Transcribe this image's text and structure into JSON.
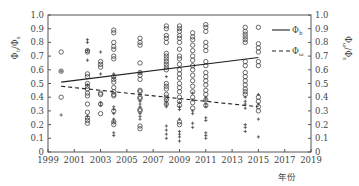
{
  "chart_data": {
    "type": "scatter",
    "title": "",
    "xlabel": "年份",
    "ylabel_left": "Φ_l/Φ_s (Φ_b/Φ_s)",
    "ylabel_right": "Φ_ω/Φ_s",
    "xlim": [
      1999,
      2019
    ],
    "ylim": [
      0,
      1.0
    ],
    "x_ticks": [
      "1999",
      "2001",
      "2003",
      "2005",
      "2007",
      "2009",
      "2011",
      "2013",
      "2015",
      "2017",
      "2019"
    ],
    "y_ticks": [
      "0",
      "0.1",
      "0.2",
      "0.3",
      "0.4",
      "0.5",
      "0.6",
      "0.7",
      "0.8",
      "0.9",
      "1.0"
    ],
    "grid": false,
    "legend_position": "upper right (outside plot)",
    "legend": [
      {
        "label": "Φ_b",
        "style": "solid"
      },
      {
        "label": "Φ_ω",
        "style": "dashed"
      }
    ],
    "trend_lines": [
      {
        "name": "Φ_b",
        "style": "solid",
        "x": [
          2000,
          2015
        ],
        "y": [
          0.51,
          0.69
        ]
      },
      {
        "name": "Φ_ω",
        "style": "dashed",
        "x": [
          2000,
          2015
        ],
        "y": [
          0.48,
          0.33
        ]
      }
    ],
    "series": [
      {
        "name": "circles",
        "marker": "o",
        "points": [
          [
            2000,
            0.73
          ],
          [
            2000,
            0.59
          ],
          [
            2000,
            0.4
          ],
          [
            2002,
            0.74
          ],
          [
            2002,
            0.73
          ],
          [
            2002,
            0.57
          ],
          [
            2002,
            0.55
          ],
          [
            2002,
            0.5
          ],
          [
            2002,
            0.48
          ],
          [
            2002,
            0.46
          ],
          [
            2002,
            0.43
          ],
          [
            2002,
            0.41
          ],
          [
            2002,
            0.35
          ],
          [
            2002,
            0.29
          ],
          [
            2002,
            0.25
          ],
          [
            2002,
            0.23
          ],
          [
            2002,
            0.21
          ],
          [
            2003,
            0.66
          ],
          [
            2003,
            0.64
          ],
          [
            2003,
            0.62
          ],
          [
            2003,
            0.43
          ],
          [
            2003,
            0.42
          ],
          [
            2003,
            0.35
          ],
          [
            2003,
            0.28
          ],
          [
            2004,
            0.89
          ],
          [
            2004,
            0.87
          ],
          [
            2004,
            0.8
          ],
          [
            2004,
            0.77
          ],
          [
            2004,
            0.75
          ],
          [
            2004,
            0.7
          ],
          [
            2004,
            0.68
          ],
          [
            2004,
            0.55
          ],
          [
            2004,
            0.53
          ],
          [
            2004,
            0.51
          ],
          [
            2004,
            0.47
          ],
          [
            2004,
            0.44
          ],
          [
            2004,
            0.42
          ],
          [
            2004,
            0.41
          ],
          [
            2004,
            0.3
          ],
          [
            2004,
            0.22
          ],
          [
            2004,
            0.2
          ],
          [
            2006,
            0.83
          ],
          [
            2006,
            0.8
          ],
          [
            2006,
            0.78
          ],
          [
            2006,
            0.65
          ],
          [
            2006,
            0.58
          ],
          [
            2006,
            0.56
          ],
          [
            2006,
            0.53
          ],
          [
            2006,
            0.45
          ],
          [
            2006,
            0.44
          ],
          [
            2006,
            0.4
          ],
          [
            2006,
            0.39
          ],
          [
            2006,
            0.31
          ],
          [
            2006,
            0.3
          ],
          [
            2006,
            0.19
          ],
          [
            2006,
            0.17
          ],
          [
            2008,
            0.92
          ],
          [
            2008,
            0.9
          ],
          [
            2008,
            0.85
          ],
          [
            2008,
            0.83
          ],
          [
            2008,
            0.8
          ],
          [
            2008,
            0.72
          ],
          [
            2008,
            0.7
          ],
          [
            2008,
            0.68
          ],
          [
            2008,
            0.66
          ],
          [
            2008,
            0.64
          ],
          [
            2008,
            0.62
          ],
          [
            2008,
            0.6
          ],
          [
            2008,
            0.5
          ],
          [
            2008,
            0.48
          ],
          [
            2008,
            0.46
          ],
          [
            2008,
            0.42
          ],
          [
            2008,
            0.4
          ],
          [
            2008,
            0.38
          ],
          [
            2008,
            0.35
          ],
          [
            2009,
            0.92
          ],
          [
            2009,
            0.9
          ],
          [
            2009,
            0.88
          ],
          [
            2009,
            0.85
          ],
          [
            2009,
            0.83
          ],
          [
            2009,
            0.8
          ],
          [
            2009,
            0.75
          ],
          [
            2009,
            0.7
          ],
          [
            2009,
            0.68
          ],
          [
            2009,
            0.64
          ],
          [
            2009,
            0.6
          ],
          [
            2009,
            0.57
          ],
          [
            2009,
            0.54
          ],
          [
            2009,
            0.5
          ],
          [
            2009,
            0.47
          ],
          [
            2009,
            0.44
          ],
          [
            2009,
            0.4
          ],
          [
            2009,
            0.37
          ],
          [
            2009,
            0.34
          ],
          [
            2009,
            0.22
          ],
          [
            2009,
            0.2
          ],
          [
            2010,
            0.87
          ],
          [
            2010,
            0.84
          ],
          [
            2010,
            0.82
          ],
          [
            2010,
            0.78
          ],
          [
            2010,
            0.74
          ],
          [
            2010,
            0.7
          ],
          [
            2010,
            0.67
          ],
          [
            2010,
            0.63
          ],
          [
            2010,
            0.6
          ],
          [
            2010,
            0.56
          ],
          [
            2010,
            0.52
          ],
          [
            2010,
            0.48
          ],
          [
            2010,
            0.44
          ],
          [
            2010,
            0.4
          ],
          [
            2010,
            0.36
          ],
          [
            2010,
            0.32
          ],
          [
            2011,
            0.93
          ],
          [
            2011,
            0.91
          ],
          [
            2011,
            0.88
          ],
          [
            2011,
            0.8
          ],
          [
            2011,
            0.77
          ],
          [
            2011,
            0.74
          ],
          [
            2011,
            0.66
          ],
          [
            2011,
            0.63
          ],
          [
            2011,
            0.58
          ],
          [
            2011,
            0.55
          ],
          [
            2011,
            0.52
          ],
          [
            2011,
            0.49
          ],
          [
            2011,
            0.45
          ],
          [
            2011,
            0.42
          ],
          [
            2011,
            0.38
          ],
          [
            2011,
            0.34
          ],
          [
            2014,
            0.91
          ],
          [
            2014,
            0.88
          ],
          [
            2014,
            0.86
          ],
          [
            2014,
            0.84
          ],
          [
            2014,
            0.82
          ],
          [
            2014,
            0.8
          ],
          [
            2014,
            0.66
          ],
          [
            2014,
            0.63
          ],
          [
            2014,
            0.58
          ],
          [
            2014,
            0.55
          ],
          [
            2014,
            0.52
          ],
          [
            2014,
            0.49
          ],
          [
            2014,
            0.46
          ],
          [
            2014,
            0.44
          ],
          [
            2014,
            0.42
          ],
          [
            2015,
            0.91
          ],
          [
            2015,
            0.79
          ],
          [
            2015,
            0.76
          ],
          [
            2015,
            0.73
          ],
          [
            2015,
            0.66
          ],
          [
            2015,
            0.63
          ],
          [
            2015,
            0.4
          ],
          [
            2015,
            0.37
          ],
          [
            2015,
            0.33
          ],
          [
            2015,
            0.3
          ]
        ]
      },
      {
        "name": "crosses",
        "marker": "+",
        "points": [
          [
            2000,
            0.59
          ],
          [
            2000,
            0.27
          ],
          [
            2002,
            0.82
          ],
          [
            2002,
            0.8
          ],
          [
            2002,
            0.74
          ],
          [
            2002,
            0.67
          ],
          [
            2002,
            0.49
          ],
          [
            2002,
            0.26
          ],
          [
            2003,
            0.73
          ],
          [
            2003,
            0.57
          ],
          [
            2003,
            0.36
          ],
          [
            2003,
            0.34
          ],
          [
            2004,
            0.57
          ],
          [
            2004,
            0.54
          ],
          [
            2004,
            0.33
          ],
          [
            2004,
            0.31
          ],
          [
            2004,
            0.28
          ],
          [
            2004,
            0.24
          ],
          [
            2004,
            0.22
          ],
          [
            2004,
            0.14
          ],
          [
            2004,
            0.12
          ],
          [
            2006,
            0.58
          ],
          [
            2006,
            0.37
          ],
          [
            2006,
            0.35
          ],
          [
            2006,
            0.33
          ],
          [
            2006,
            0.28
          ],
          [
            2006,
            0.26
          ],
          [
            2006,
            0.24
          ],
          [
            2008,
            0.55
          ],
          [
            2008,
            0.37
          ],
          [
            2008,
            0.35
          ],
          [
            2008,
            0.33
          ],
          [
            2008,
            0.19
          ],
          [
            2008,
            0.16
          ],
          [
            2008,
            0.13
          ],
          [
            2008,
            0.1
          ],
          [
            2009,
            0.36
          ],
          [
            2009,
            0.33
          ],
          [
            2009,
            0.31
          ],
          [
            2009,
            0.24
          ],
          [
            2009,
            0.15
          ],
          [
            2009,
            0.13
          ],
          [
            2009,
            0.11
          ],
          [
            2009,
            0.08
          ],
          [
            2010,
            0.43
          ],
          [
            2010,
            0.38
          ],
          [
            2010,
            0.3
          ],
          [
            2010,
            0.28
          ],
          [
            2010,
            0.21
          ],
          [
            2010,
            0.18
          ],
          [
            2011,
            0.4
          ],
          [
            2011,
            0.38
          ],
          [
            2011,
            0.35
          ],
          [
            2011,
            0.33
          ],
          [
            2011,
            0.25
          ],
          [
            2011,
            0.23
          ],
          [
            2011,
            0.14
          ],
          [
            2011,
            0.12
          ],
          [
            2011,
            0.1
          ],
          [
            2014,
            0.4
          ],
          [
            2014,
            0.37
          ],
          [
            2014,
            0.35
          ],
          [
            2014,
            0.32
          ],
          [
            2014,
            0.2
          ],
          [
            2014,
            0.18
          ],
          [
            2014,
            0.15
          ],
          [
            2015,
            0.42
          ],
          [
            2015,
            0.35
          ],
          [
            2015,
            0.24
          ],
          [
            2015,
            0.11
          ]
        ]
      }
    ]
  }
}
